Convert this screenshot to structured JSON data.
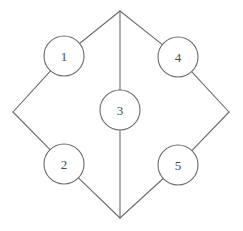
{
  "figure": {
    "title": "",
    "background_color": "#ffffff",
    "width": 243,
    "height": 231
  },
  "style": {
    "stroke_color": "#6b6b6b",
    "node_fill": "#ffffff",
    "label_color": "#4a4a4a",
    "stroke_width": 1.1,
    "node_radius": 20
  },
  "graph": {
    "type": "undirected-node-link-diagram",
    "node_count": 5,
    "nodes": [
      {
        "id": "1",
        "label": "1",
        "cx": 64,
        "cy": 56,
        "r": 20
      },
      {
        "id": "2",
        "label": "2",
        "cx": 64,
        "cy": 164,
        "r": 20
      },
      {
        "id": "3",
        "label": "3",
        "cx": 120,
        "cy": 110,
        "r": 20
      },
      {
        "id": "4",
        "label": "4",
        "cx": 178,
        "cy": 57,
        "r": 20
      },
      {
        "id": "5",
        "label": "5",
        "cx": 178,
        "cy": 165,
        "r": 20
      }
    ],
    "junctions": [
      {
        "id": "top",
        "x": 120,
        "y": 11
      },
      {
        "id": "left",
        "x": 13,
        "y": 112
      },
      {
        "id": "right",
        "x": 229,
        "y": 112
      },
      {
        "id": "bottom",
        "x": 120,
        "y": 218
      }
    ],
    "edges": [
      {
        "from": "top",
        "to": "1",
        "x1": 120,
        "y1": 11,
        "x2": 64,
        "y2": 56
      },
      {
        "from": "top",
        "to": "3",
        "x1": 120,
        "y1": 11,
        "x2": 120,
        "y2": 110
      },
      {
        "from": "top",
        "to": "4",
        "x1": 120,
        "y1": 11,
        "x2": 178,
        "y2": 57
      },
      {
        "from": "1",
        "to": "left",
        "x1": 64,
        "y1": 56,
        "x2": 13,
        "y2": 112
      },
      {
        "from": "left",
        "to": "2",
        "x1": 13,
        "y1": 112,
        "x2": 64,
        "y2": 164
      },
      {
        "from": "2",
        "to": "bottom",
        "x1": 64,
        "y1": 164,
        "x2": 120,
        "y2": 218
      },
      {
        "from": "3",
        "to": "bottom",
        "x1": 120,
        "y1": 110,
        "x2": 120,
        "y2": 218
      },
      {
        "from": "4",
        "to": "right",
        "x1": 178,
        "y1": 57,
        "x2": 229,
        "y2": 112
      },
      {
        "from": "right",
        "to": "5",
        "x1": 229,
        "y1": 112,
        "x2": 178,
        "y2": 165
      },
      {
        "from": "5",
        "to": "bottom",
        "x1": 178,
        "y1": 165,
        "x2": 120,
        "y2": 218
      }
    ]
  }
}
